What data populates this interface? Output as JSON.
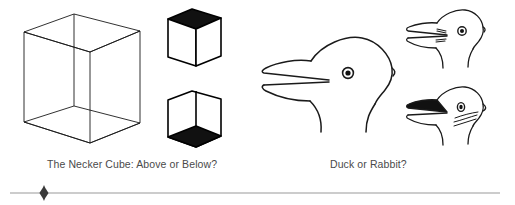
{
  "page": {
    "background_color": "#ffffff",
    "width": 515,
    "height": 205
  },
  "figures": {
    "left": {
      "name": "necker-cube-group",
      "caption": "The Necker Cube: Above or Below?",
      "caption_color": "#4a4a4a",
      "parts": [
        {
          "name": "necker-cube-wireframe",
          "description": "transparent wireframe cube, all twelve edges drawn, ambiguous orientation",
          "stroke_color": "#1a1a1a",
          "fill": "none"
        },
        {
          "name": "cube-above-solid",
          "description": "solid cube seen from above, black top face",
          "stroke_color": "#000000",
          "shaded_face": "top",
          "shade_color": "#111111"
        },
        {
          "name": "cube-below-solid",
          "description": "solid cube seen from below, black bottom face",
          "stroke_color": "#000000",
          "shaded_face": "bottom",
          "shade_color": "#111111"
        }
      ]
    },
    "right": {
      "name": "duck-rabbit-group",
      "caption": "Duck or Rabbit?",
      "caption_color": "#4a4a4a",
      "parts": [
        {
          "name": "duck-rabbit-ambiguous",
          "description": "large ambiguous head outline facing left with open bill and round eye",
          "stroke_color": "#1a1a1a",
          "fill": "none"
        },
        {
          "name": "duck-reading",
          "description": "small head resolved as a duck, open bill, round duck eye",
          "stroke_color": "#1a1a1a",
          "fill": "none"
        },
        {
          "name": "rabbit-reading",
          "description": "small head resolved as a rabbit, ears with dark interior, oval eye and whiskers",
          "stroke_color": "#1a1a1a",
          "fill": "none"
        }
      ]
    }
  },
  "footer": {
    "rule_color": "#9a9a9a",
    "ornament": "diamond-ornament",
    "ornament_color": "#3a3a3a"
  }
}
